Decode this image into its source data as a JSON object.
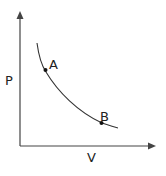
{
  "diagram": {
    "type": "pv-curve",
    "axes": {
      "y_label": "P",
      "x_label": "V"
    },
    "curve": {
      "description": "decreasing hyperbolic-like curve",
      "color": "#333333"
    },
    "points": [
      {
        "label": "A",
        "position": "upper-left on curve"
      },
      {
        "label": "B",
        "position": "lower-right on curve"
      }
    ]
  }
}
